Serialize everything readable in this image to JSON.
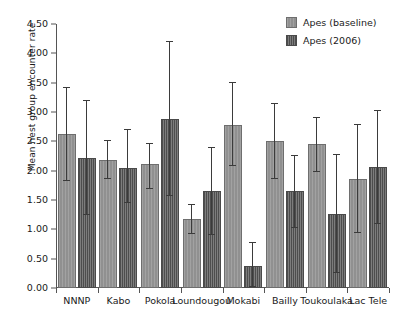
{
  "chart_data": {
    "type": "bar",
    "title": "",
    "subtitle": "",
    "xlabel": "",
    "ylabel": "Mean nest group encounter rate",
    "ylim": [
      0.0,
      4.5
    ],
    "ytick_labels": [
      "0.00",
      "0.50",
      "1.00",
      "1.50",
      "2.00",
      "2.50",
      "3.00",
      "3.50",
      "4.00",
      "4.50"
    ],
    "ytick_values": [
      0.0,
      0.5,
      1.0,
      1.5,
      2.0,
      2.5,
      3.0,
      3.5,
      4.0,
      4.5
    ],
    "grid": false,
    "legend_position": "top-right",
    "categories": [
      "NNNP",
      "Kabo",
      "Pokola",
      "Loundougou",
      "Mokabi",
      "Bailly",
      "Toukoulaka",
      "Lac Tele"
    ],
    "series": [
      {
        "name": "Apes (baseline)",
        "color": "#909090",
        "values": [
          2.63,
          2.19,
          2.12,
          1.18,
          2.78,
          2.5,
          2.45,
          1.86
        ],
        "err_low": [
          1.82,
          1.85,
          1.69,
          0.92,
          2.08,
          1.85,
          1.98,
          0.94
        ],
        "err_high": [
          3.43,
          2.53,
          2.47,
          1.44,
          3.51,
          3.15,
          2.92,
          2.79
        ]
      },
      {
        "name": "Apes (2006)",
        "color": "#6e6e6e",
        "values": [
          2.21,
          2.05,
          2.88,
          1.66,
          0.37,
          1.65,
          1.27,
          2.06
        ],
        "err_low": [
          1.25,
          1.45,
          1.56,
          0.91,
          0.02,
          1.02,
          0.25,
          1.09
        ],
        "err_high": [
          3.2,
          2.71,
          4.21,
          2.41,
          0.79,
          2.27,
          2.28,
          3.04
        ]
      }
    ]
  },
  "legend": {
    "items": [
      {
        "label": "Apes (baseline)"
      },
      {
        "label": "Apes (2006)"
      }
    ]
  }
}
